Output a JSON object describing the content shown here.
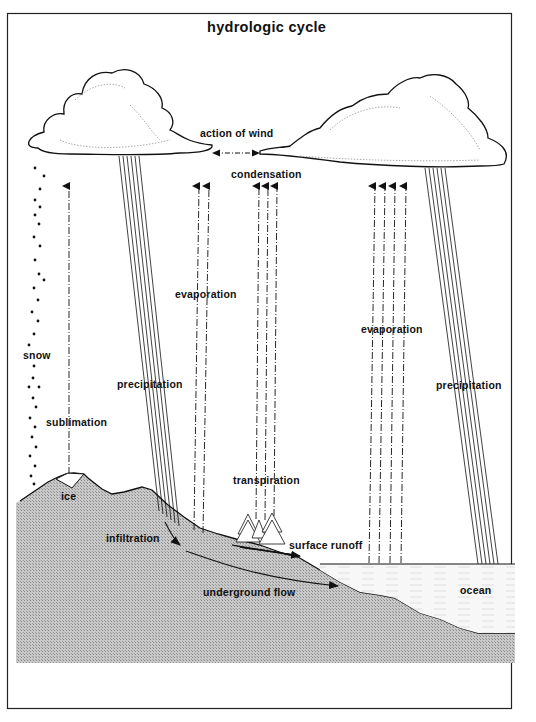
{
  "diagram": {
    "title": "hydrologic cycle",
    "labels": {
      "action_of_wind": "action of wind",
      "condensation": "condensation",
      "evaporation_land": "evaporation",
      "evaporation_ocean": "evaporation",
      "snow": "snow",
      "precipitation_land": "precipitation",
      "precipitation_ocean": "precipitation",
      "sublimation": "sublimation",
      "transpiration": "transpiration",
      "ice": "ice",
      "infiltration": "infiltration",
      "surface_runoff": "surface runoff",
      "underground_flow": "underground flow",
      "ocean": "ocean"
    },
    "elements": {
      "clouds": [
        "left-cloud",
        "right-cloud"
      ],
      "arrows": [
        "wind-double-arrow",
        "sublimation-arrow",
        "evaporation-land-arrows",
        "transpiration-arrows",
        "evaporation-ocean-arrows",
        "infiltration-arrow",
        "surface-runoff-arrow",
        "underground-flow-arrow"
      ],
      "features": [
        "mountain-land",
        "ice-cap",
        "trees",
        "ocean-water",
        "snowfall-dots",
        "rain-streaks"
      ]
    },
    "colors": {
      "ink": "#111111",
      "land": "#bdbdbd",
      "ocean": "#f4f4f4",
      "background": "#ffffff"
    }
  }
}
